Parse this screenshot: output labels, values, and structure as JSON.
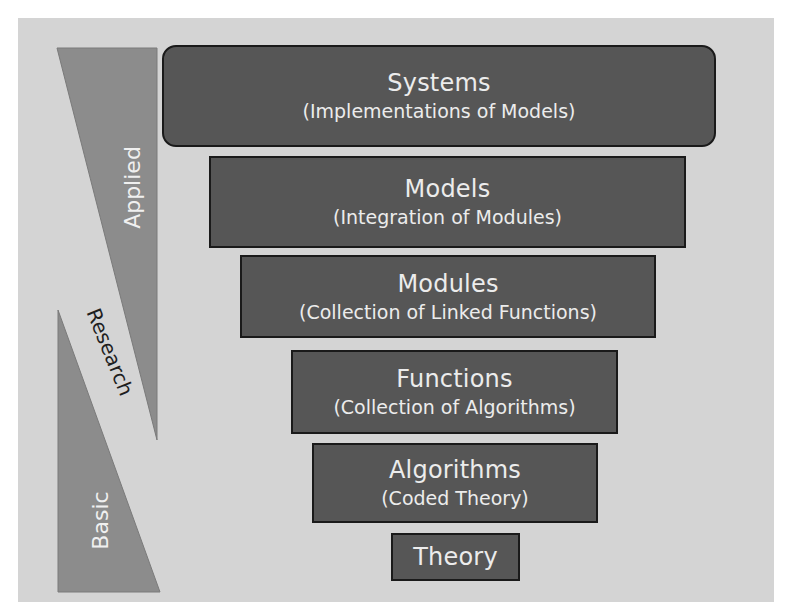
{
  "colors": {
    "panel_bg": "#d4d4d4",
    "box_fill": "#565656",
    "box_border": "#1a1a1a",
    "box_text": "#ececec",
    "triangle_fill": "#8c8c8c"
  },
  "side_labels": {
    "applied": "Applied",
    "research": "Research",
    "basic": "Basic"
  },
  "levels": [
    {
      "title": "Systems",
      "subtitle": "(Implementations of Models)"
    },
    {
      "title": "Models",
      "subtitle": "(Integration of Modules)"
    },
    {
      "title": "Modules",
      "subtitle": "(Collection of Linked Functions)"
    },
    {
      "title": "Functions",
      "subtitle": "(Collection of Algorithms)"
    },
    {
      "title": "Algorithms",
      "subtitle": "(Coded Theory)"
    },
    {
      "title": "Theory",
      "subtitle": ""
    }
  ]
}
